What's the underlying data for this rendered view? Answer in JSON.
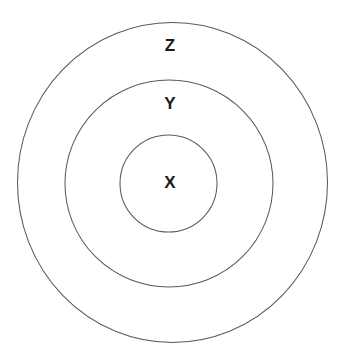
{
  "diagram": {
    "type": "concentric-circles",
    "background_color": "#ffffff",
    "stroke_color": "#5a5a5a",
    "label_color": "#1a1a1a",
    "canvas": {
      "width": 346,
      "height": 361
    },
    "rings": [
      {
        "id": "outer",
        "label": "Z",
        "center_x": 172.5,
        "center_y": 182.5,
        "radius_x": 155,
        "radius_y": 160,
        "label_x": 170,
        "label_y": 45
      },
      {
        "id": "middle",
        "label": "Y",
        "center_x": 169,
        "center_y": 183.5,
        "radius_x": 104,
        "radius_y": 103.5,
        "label_x": 170,
        "label_y": 103
      },
      {
        "id": "inner",
        "label": "X",
        "center_x": 168.5,
        "center_y": 183.5,
        "radius_x": 48.5,
        "radius_y": 48.5,
        "label_x": 170,
        "label_y": 182
      }
    ]
  }
}
